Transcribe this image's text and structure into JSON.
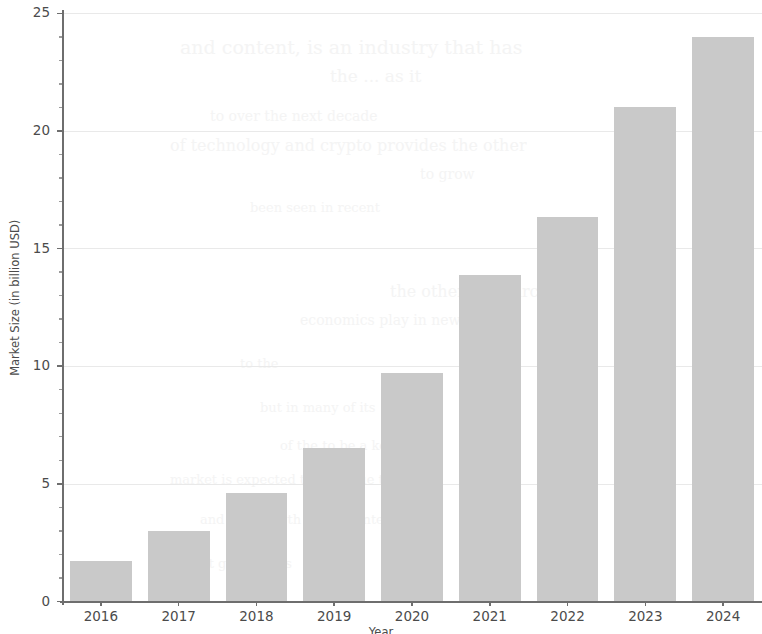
{
  "chart_data": {
    "type": "bar",
    "title": "",
    "subtitle": "",
    "xlabel": "Year",
    "ylabel": "Market Size (in billion USD)",
    "categories": [
      "2016",
      "2017",
      "2018",
      "2019",
      "2020",
      "2021",
      "2022",
      "2023",
      "2024"
    ],
    "values": [
      1.7,
      3.0,
      4.6,
      6.5,
      9.7,
      13.85,
      16.35,
      21.0,
      24.0
    ],
    "ylim": [
      0,
      25
    ],
    "yticks": [
      0,
      5,
      10,
      15,
      20,
      25
    ],
    "ytick_labels": [
      "0",
      "5",
      "10",
      "15",
      "20",
      "25"
    ],
    "y_minor_ticks": [
      1,
      2,
      3,
      4,
      6,
      7,
      8,
      9,
      11,
      12,
      13,
      14,
      16,
      17,
      18,
      19,
      21,
      22,
      23,
      24
    ],
    "grid": true,
    "legend": null,
    "bar_color": "#c9c9c9",
    "axis_color": "#6e6e6e",
    "grid_color": "#e9e9e9",
    "background": "#ffffff"
  },
  "ghost_text": {
    "lines": [
      {
        "text": "and content, is an industry that has",
        "x": 180,
        "y": 36,
        "size": 19
      },
      {
        "text": "the ... as it",
        "x": 330,
        "y": 66,
        "size": 17
      },
      {
        "text": "to over the next decade",
        "x": 210,
        "y": 108,
        "size": 14
      },
      {
        "text": "of technology and crypto provides the other",
        "x": 170,
        "y": 136,
        "size": 16
      },
      {
        "text": "to grow",
        "x": 420,
        "y": 166,
        "size": 14
      },
      {
        "text": "been seen in recent",
        "x": 250,
        "y": 200,
        "size": 13
      },
      {
        "text": "the other. Researchers",
        "x": 390,
        "y": 282,
        "size": 16
      },
      {
        "text": "economics play in new",
        "x": 300,
        "y": 312,
        "size": 14
      },
      {
        "text": "to the",
        "x": 240,
        "y": 356,
        "size": 13
      },
      {
        "text": "but in many of its",
        "x": 260,
        "y": 400,
        "size": 13
      },
      {
        "text": "of the to be a key",
        "x": 280,
        "y": 438,
        "size": 13
      },
      {
        "text": "market is expected to continue the",
        "x": 170,
        "y": 472,
        "size": 13
      },
      {
        "text": "and the growth of the content",
        "x": 200,
        "y": 512,
        "size": 13
      },
      {
        "text": "of market growth has",
        "x": 150,
        "y": 556,
        "size": 13
      }
    ]
  }
}
